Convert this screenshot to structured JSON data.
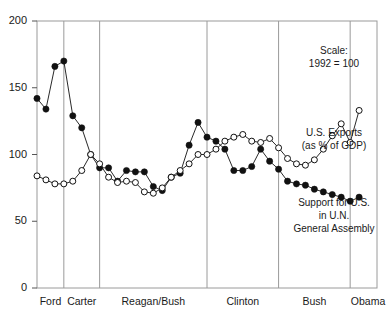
{
  "chart_data": {
    "type": "line",
    "title": "",
    "xlabel": "",
    "ylabel": "",
    "ylim": [
      0,
      200
    ],
    "xlim": [
      1974,
      2012
    ],
    "grid": false,
    "legend_position": "inline-annotations",
    "yticks": [
      "0",
      "50",
      "100",
      "150",
      "200"
    ],
    "ytick_values": [
      0,
      50,
      100,
      150,
      200
    ],
    "scale_note": "Scale: 1992 = 100",
    "eras": [
      {
        "label": "Ford",
        "start": 1974,
        "end": 1977
      },
      {
        "label": "Carter",
        "start": 1977,
        "end": 1981
      },
      {
        "label": "Reagan/Bush",
        "start": 1981,
        "end": 1993
      },
      {
        "label": "Clinton",
        "start": 1993,
        "end": 2001
      },
      {
        "label": "Bush",
        "start": 2001,
        "end": 2009
      },
      {
        "label": "Obama",
        "start": 2009,
        "end": 2013
      }
    ],
    "x": [
      1974,
      1975,
      1976,
      1977,
      1978,
      1979,
      1980,
      1981,
      1982,
      1983,
      1984,
      1985,
      1986,
      1987,
      1988,
      1989,
      1990,
      1991,
      1992,
      1993,
      1994,
      1995,
      1996,
      1997,
      1998,
      1999,
      2000,
      2001,
      2002,
      2003,
      2004,
      2005,
      2006,
      2007,
      2008,
      2009,
      2010
    ],
    "series": [
      {
        "name": "Support for U.S. in U.N. General Assembly",
        "marker": "filled-circle",
        "color": "#111111",
        "values": [
          142,
          134,
          166,
          170,
          129,
          120,
          100,
          90,
          90,
          80,
          88,
          87,
          87,
          76,
          73,
          83,
          86,
          107,
          124,
          113,
          110,
          104,
          88,
          88,
          91,
          104,
          95,
          89,
          80,
          78,
          77,
          74,
          72,
          70,
          68,
          65,
          68
        ]
      },
      {
        "name": "U.S. Exports (as % of GDP)",
        "marker": "open-circle",
        "color": "#111111",
        "values": [
          84,
          81,
          78,
          78,
          80,
          88,
          100,
          93,
          83,
          79,
          80,
          79,
          72,
          71,
          75,
          83,
          88,
          93,
          100,
          100,
          104,
          110,
          113,
          115,
          110,
          109,
          112,
          105,
          97,
          93,
          92,
          96,
          104,
          114,
          123,
          109,
          133
        ]
      }
    ],
    "annotations": [
      {
        "name": "scale-note",
        "lines": [
          "Scale:",
          "1992 = 100"
        ]
      },
      {
        "name": "exports-label",
        "lines": [
          "U.S. Exports",
          "(as % of GDP)"
        ]
      },
      {
        "name": "un-support-label",
        "lines": [
          "Support for U.S.",
          "in U.N.",
          "General Assembly"
        ]
      }
    ]
  },
  "axis": {
    "y_ticks": [
      {
        "label": "200",
        "value": 200
      },
      {
        "label": "150",
        "value": 150
      },
      {
        "label": "100",
        "value": 100
      },
      {
        "label": "50",
        "value": 50
      },
      {
        "label": "0",
        "value": 0
      }
    ],
    "x_ticks": [
      {
        "label": "Ford"
      },
      {
        "label": "Carter"
      },
      {
        "label": "Reagan/Bush"
      },
      {
        "label": "Clinton"
      },
      {
        "label": "Bush"
      },
      {
        "label": "Obama"
      }
    ]
  },
  "annotations": {
    "scale_line1": "Scale:",
    "scale_line2": "1992 = 100",
    "exports_line1": "U.S. Exports",
    "exports_line2": "(as % of GDP)",
    "support_line1": "Support for U.S.",
    "support_line2": "in U.N.",
    "support_line3": "General Assembly"
  },
  "colors": {
    "frame": "#9a9a9a",
    "divider": "#9a9a9a",
    "line": "#1a1a1a",
    "filled_marker": "#111111",
    "open_marker_fill": "#ffffff",
    "text": "#1a1a1a",
    "background": "#ffffff"
  }
}
